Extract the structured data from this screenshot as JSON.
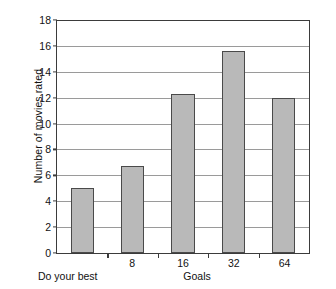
{
  "chart_data": {
    "type": "bar",
    "title": "",
    "xlabel": "Goals",
    "ylabel": "Number of movies rated",
    "categories": [
      "Do your best",
      "8",
      "16",
      "32",
      "64"
    ],
    "values": [
      5.0,
      6.7,
      12.3,
      15.6,
      12.0
    ],
    "ylim": [
      0,
      18
    ],
    "ytick_step": 2,
    "yticks": [
      0,
      2,
      4,
      6,
      8,
      10,
      12,
      14,
      16,
      18
    ],
    "ytick_labels": [
      "0",
      "2",
      "4",
      "6",
      "8",
      "10",
      "12",
      "14",
      "16",
      "18"
    ],
    "grid": "horizontal",
    "legend": "none",
    "bar_fill_color": "#b9b9b9",
    "bar_border_color": "#4a4a4a",
    "gridline_color": "#9a9a9a",
    "axis_color": "#3b3b3b",
    "background_color": "#ffffff"
  },
  "axes": {
    "y_title": "Number of movies rated",
    "x_title": "Goals",
    "first_category_caption": "Do your best"
  },
  "x_tick_labels_inline": [
    "",
    "8",
    "16",
    "32",
    "64"
  ]
}
